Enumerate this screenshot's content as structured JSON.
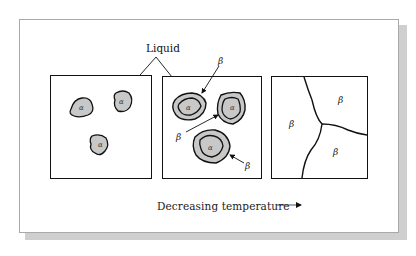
{
  "figure": {
    "title_label": "Liquid",
    "alpha_symbol": "α",
    "beta_symbol": "β",
    "caption": "Decreasing temperature",
    "arrow_icon": "right-arrow-icon",
    "panels": [
      {
        "name": "panel-1-liquid-with-alpha",
        "description": "Liquid with three α particles",
        "labels": [
          "α",
          "α",
          "α"
        ]
      },
      {
        "name": "panel-2-alpha-with-beta-shell",
        "description": "α particles surrounded by β layers in liquid",
        "labels": [
          "α",
          "α",
          "α",
          "β",
          "β",
          "β"
        ]
      },
      {
        "name": "panel-3-beta-grains",
        "description": "Fully solidified β grains",
        "labels": [
          "β",
          "β",
          "β"
        ]
      }
    ],
    "colors": {
      "phase_fill": "#c8c8c8",
      "line": "#111111",
      "shadow": "#cfcfcf",
      "frame_border": "#a9a9a9"
    }
  }
}
